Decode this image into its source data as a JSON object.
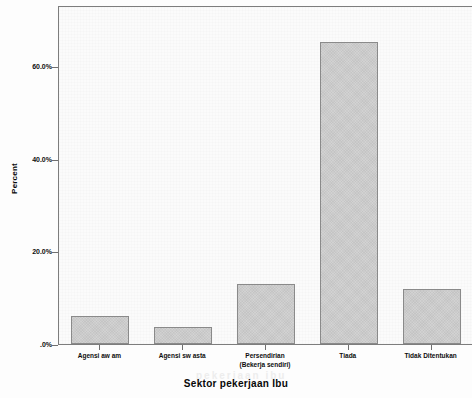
{
  "chart_data": {
    "type": "bar",
    "title": "",
    "subtitle": "",
    "xlabel": "Sektor pekerjaan Ibu",
    "ylabel": "Percent",
    "categories": [
      "Agensi aw am",
      "Agensi sw asta",
      "Persendirian\n(Bekerja sendiri)",
      "Tiada",
      "Tidak Ditentukan"
    ],
    "category_lines": [
      [
        "Agensi aw am"
      ],
      [
        "Agensi sw asta"
      ],
      [
        "Persendirian",
        "(Bekerja sendiri)"
      ],
      [
        "Tiada"
      ],
      [
        "Tidak Ditentukan"
      ]
    ],
    "values": [
      6.0,
      3.6,
      13.0,
      65.2,
      11.9
    ],
    "value_labels": [
      "6.0%",
      "3.6%",
      "13.0%",
      "65.2%",
      "11.9%"
    ],
    "ylim": [
      0,
      73.2
    ],
    "ytick_values": [
      0,
      20,
      40,
      60
    ],
    "ytick_labels": [
      ".0%",
      "20.0%",
      "40.0%",
      "60.0%"
    ],
    "grid": false,
    "legend": false,
    "bar_fill_color": "#d2d2d2",
    "bar_border_color": "#8a8a8a",
    "axis_color": "#7d7d7d",
    "plot_background": "#fbfbfb"
  },
  "artifacts": {
    "bleed_top": "ampiran",
    "bleed_mid": "kerjaan",
    "bleed_bottom": "pekerjaan ibu"
  }
}
